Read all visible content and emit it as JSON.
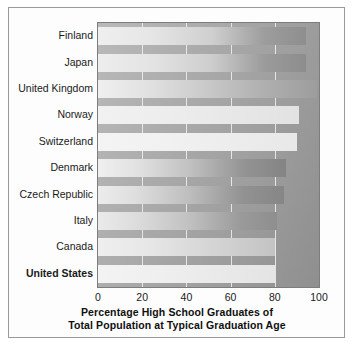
{
  "chart_data": {
    "type": "bar",
    "orientation": "horizontal",
    "title": "",
    "xlabel_lines": [
      "Percentage High School Graduates of",
      "Total Population at Typical Graduation Age"
    ],
    "ylabel": "",
    "categories": [
      "Finland",
      "Japan",
      "United Kingdom",
      "Norway",
      "Switzerland",
      "Denmark",
      "Czech Republic",
      "Italy",
      "Canada",
      "United States"
    ],
    "values": [
      94,
      94,
      99,
      91,
      90,
      85,
      84,
      81,
      80,
      80
    ],
    "xlim": [
      0,
      100
    ],
    "xticks": [
      0,
      20,
      40,
      60,
      80,
      100
    ],
    "xtick_labels": [
      "0",
      "20",
      "40",
      "60",
      "80",
      "100"
    ],
    "gridlines": [
      20,
      40,
      60,
      80
    ],
    "grid": true,
    "legend": null,
    "highlighted_category": "United States",
    "bar_fills": [
      "light-to-dark-grey",
      "light-to-dark-grey",
      "light-grey-flat",
      "very-light-grey",
      "very-light-grey",
      "light-to-dark-grey",
      "light-to-dark-grey",
      "light-to-dark-grey",
      "light-grey",
      "very-light-grey"
    ],
    "colors": {
      "plot_background_light": "#b9b9b9",
      "plot_background_dark": "#8f8f8f",
      "gridline": "#f2f2f2",
      "axis_border": "#7d7d7d",
      "figure_border": "#9a9a9a",
      "text": "#1a1a1a",
      "page_background": "#ffffff"
    }
  }
}
